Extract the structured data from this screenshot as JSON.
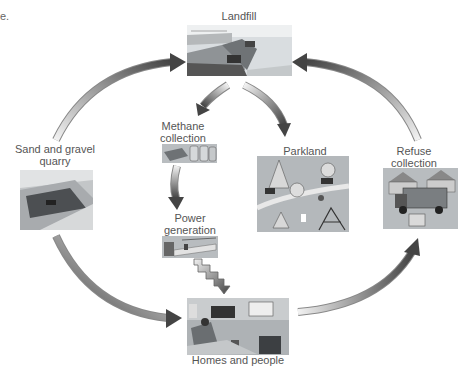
{
  "fragment": "e.",
  "nodes": {
    "landfill": {
      "label": "Landfill"
    },
    "methane": {
      "label_line1": "Methane",
      "label_line2": "collection"
    },
    "parkland": {
      "label": "Parkland"
    },
    "quarry": {
      "label_line1": "Sand and gravel",
      "label_line2": "quarry"
    },
    "refuse": {
      "label_line1": "Refuse",
      "label_line2": "collection"
    },
    "power": {
      "label_line1": "Power",
      "label_line2": "generation"
    },
    "homes": {
      "label": "Homes and people"
    }
  },
  "flows": [
    {
      "from": "Sand and gravel quarry",
      "to": "Landfill"
    },
    {
      "from": "Refuse collection",
      "to": "Landfill"
    },
    {
      "from": "Landfill",
      "to": "Methane collection"
    },
    {
      "from": "Landfill",
      "to": "Parkland"
    },
    {
      "from": "Methane collection",
      "to": "Power generation"
    },
    {
      "from": "Power generation",
      "to": "Homes and people"
    },
    {
      "from": "Sand and gravel quarry",
      "to": "Homes and people"
    },
    {
      "from": "Homes and people",
      "to": "Refuse collection"
    }
  ],
  "colors": {
    "arrow_dark": "#4a4a4a",
    "arrow_light": "#e6e6e6",
    "text": "#555555"
  }
}
